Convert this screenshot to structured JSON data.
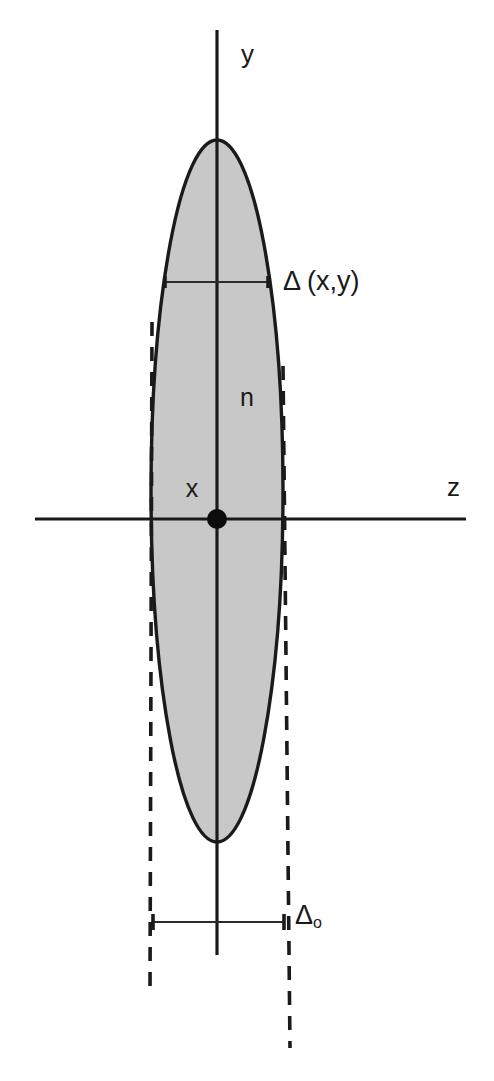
{
  "figure": {
    "kind": "technical-diagram",
    "background_color": "#ffffff",
    "fill_color": "#c8c8c8",
    "line_color": "#1a1a1a"
  },
  "axes": {
    "vertical": {
      "label": "y",
      "label_x": 241,
      "label_y": 56,
      "x": 217,
      "y_top": 30,
      "y_bottom": 955
    },
    "horizontal": {
      "label": "z",
      "label_x": 447,
      "label_y": 489,
      "y": 519,
      "x_left": 35,
      "x_right": 466
    }
  },
  "origin": {
    "label": "origin-dot",
    "cx": 217,
    "cy": 519,
    "r": 10
  },
  "shape": {
    "name": "ellipse",
    "cx": 217,
    "cy": 491,
    "rx": 66,
    "ry": 351
  },
  "labels": {
    "normal": "n",
    "normal_x": 247,
    "normal_y": 399,
    "position": "x",
    "position_x": 192,
    "position_y": 490,
    "width_function": "Δ  (x,y)",
    "width_function_x": 283,
    "width_function_y": 283,
    "equilibrium_symbol": "Δ",
    "equilibrium_subscript": "o",
    "equilibrium_x": 295,
    "equilibrium_y": 917
  },
  "dimensions": {
    "delta_xy": {
      "label": "Δ  (x,y)",
      "y": 282,
      "x_start": 164,
      "x_end": 269
    },
    "delta_0": {
      "label": "Δo",
      "y": 922,
      "x_start": 152,
      "x_end": 285
    }
  },
  "guides": [
    {
      "name": "tangent-left",
      "x_top": 152,
      "y_top": 322,
      "x_bottom": 150,
      "y_bottom": 992
    },
    {
      "name": "tangent-right",
      "x_top": 283,
      "y_top": 366,
      "x_bottom": 290,
      "y_bottom": 1048
    }
  ]
}
